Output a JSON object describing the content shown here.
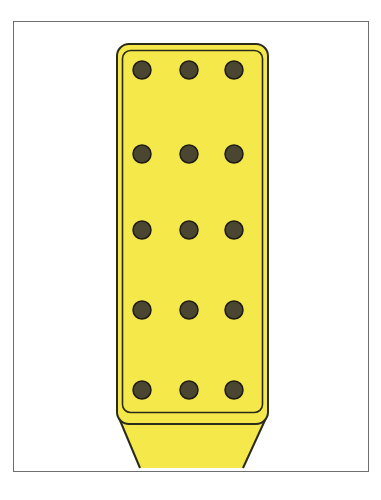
{
  "figure": {
    "colors": {
      "fill": "#f5e84a",
      "outline": "#2a2a1a",
      "hole": "#4a4632",
      "frame": "#6f6f6f",
      "background": "#ffffff"
    },
    "grid": {
      "columns": 3,
      "rows": 5,
      "col_x": [
        142,
        189,
        234
      ],
      "row_y": [
        70,
        154,
        230,
        310,
        390
      ],
      "hole_radius": 9
    }
  }
}
